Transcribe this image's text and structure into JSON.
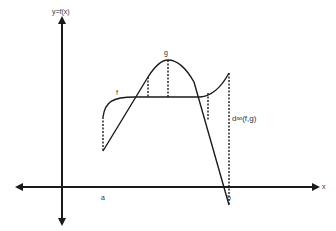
{
  "diagram": {
    "labels": {
      "y_axis": "y=f(x)",
      "x_axis": "x",
      "a": "a",
      "b": "b",
      "f": "f",
      "g": "g",
      "distance": "d∞(f,g)"
    },
    "colors": {
      "stroke": "#1a1a1a",
      "text": "#333333",
      "background": "#ffffff"
    },
    "curves": {
      "f": "M103,117 C105,102 112,97 135,97 L200,97 C212,96 222,86 229,73",
      "g": "M103,151 L148,77 C155,66 161,60 168,60 C178,60 186,68 194,82 L229,205"
    },
    "dashed_segments": [
      {
        "x": 103,
        "y1": 117,
        "y2": 151
      },
      {
        "x": 148,
        "y1": 77,
        "y2": 97
      },
      {
        "x": 168,
        "y1": 60,
        "y2": 97
      },
      {
        "x": 208,
        "y1": 93,
        "y2": 120
      },
      {
        "x": 229,
        "y1": 73,
        "y2": 205
      }
    ]
  }
}
